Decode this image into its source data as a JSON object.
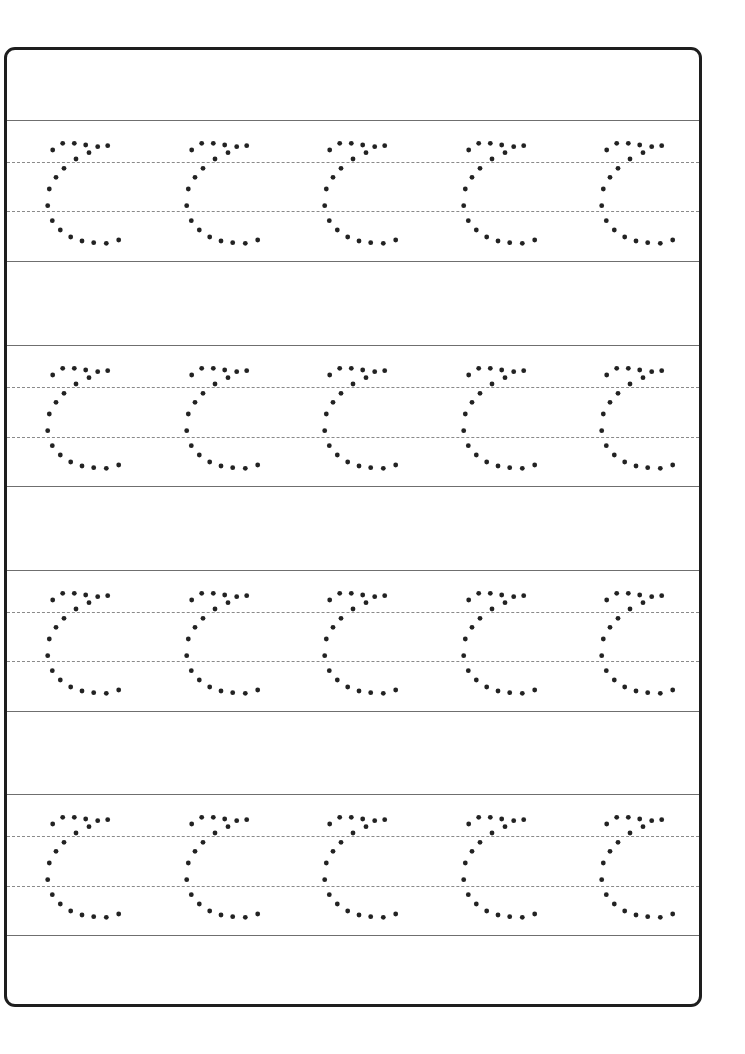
{
  "worksheet": {
    "title": "",
    "letter": "C",
    "letter_style": "dotted-tracing",
    "rows": 4,
    "columns": 5,
    "colors": {
      "border": "#1e1e1e",
      "solid_line": "#6f6f6f",
      "dotted_line": "#8a8a8a",
      "dot": "#222222"
    },
    "row_lines": [
      {
        "top": 120,
        "mid_upper": 162,
        "mid_lower": 211,
        "bottom": 261
      },
      {
        "top": 345,
        "mid_upper": 387,
        "mid_lower": 437,
        "bottom": 486
      },
      {
        "top": 570,
        "mid_upper": 612,
        "mid_lower": 661,
        "bottom": 711
      },
      {
        "top": 794,
        "mid_upper": 836,
        "mid_lower": 886,
        "bottom": 935
      }
    ],
    "column_offsets_x": [
      0,
      138.5,
      277,
      415.5,
      554
    ],
    "glyph_dots": [
      [
        52.7,
        150
      ],
      [
        62.7,
        143.3
      ],
      [
        74.3,
        143.3
      ],
      [
        85.7,
        145
      ],
      [
        97.7,
        146.7
      ],
      [
        107.7,
        145.7
      ],
      [
        89,
        152.7
      ],
      [
        76,
        159
      ],
      [
        64,
        168.3
      ],
      [
        56,
        177.3
      ],
      [
        49.3,
        189
      ],
      [
        47.7,
        205.7
      ],
      [
        52.3,
        220.7
      ],
      [
        60.3,
        230
      ],
      [
        70.7,
        237
      ],
      [
        82,
        241
      ],
      [
        93.7,
        242.7
      ],
      [
        106.3,
        243.3
      ],
      [
        118.7,
        240
      ]
    ],
    "glyph_origin_row_top": 120,
    "dot_radius": 2.4
  }
}
